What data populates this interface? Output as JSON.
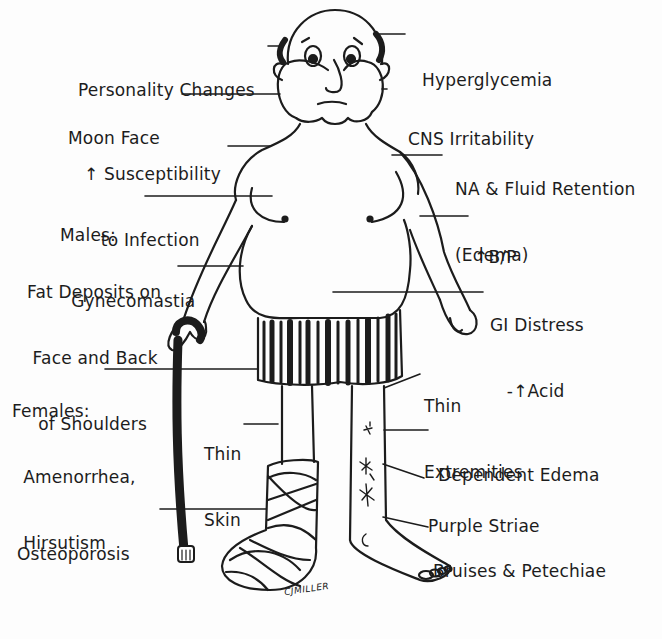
{
  "diagram": {
    "signature": "CJMILLER",
    "labels_left": [
      {
        "id": "personality-changes",
        "lines": [
          "Personality Changes"
        ],
        "x": 78,
        "y": 35
      },
      {
        "id": "moon-face",
        "lines": [
          "Moon Face"
        ],
        "x": 68,
        "y": 83
      },
      {
        "id": "susceptibility-infection",
        "lines": [
          "↑ Susceptibility",
          "   to Infection"
        ],
        "x": 84,
        "y": 119
      },
      {
        "id": "males-gynecomastia",
        "lines": [
          "Males:",
          "  Gynecomastia"
        ],
        "x": 60,
        "y": 180
      },
      {
        "id": "fat-deposits",
        "lines": [
          "Fat Deposits on",
          " Face and Back",
          "  of Shoulders"
        ],
        "x": 27,
        "y": 237
      },
      {
        "id": "females",
        "lines": [
          "Females:",
          "  Amenorrhea,",
          "  Hirsutism"
        ],
        "x": 12,
        "y": 356
      },
      {
        "id": "thin-skin",
        "lines": [
          "Thin",
          "Skin"
        ],
        "x": 204,
        "y": 399
      },
      {
        "id": "osteoporosis",
        "lines": [
          "Osteoporosis"
        ],
        "x": 17,
        "y": 499
      }
    ],
    "labels_right": [
      {
        "id": "hyperglycemia",
        "lines": [
          "Hyperglycemia"
        ],
        "x": 422,
        "y": 25
      },
      {
        "id": "cns-irritability",
        "lines": [
          "CNS Irritability"
        ],
        "x": 408,
        "y": 84
      },
      {
        "id": "na-fluid-retention",
        "lines": [
          "NA & Fluid Retention",
          "(Edema)"
        ],
        "x": 455,
        "y": 134
      },
      {
        "id": "blood-pressure",
        "lines": [
          "↑B/P"
        ],
        "x": 474,
        "y": 202
      },
      {
        "id": "gi-distress",
        "lines": [
          "GI Distress",
          "   -↑Acid"
        ],
        "x": 490,
        "y": 270
      },
      {
        "id": "thin-extremities",
        "lines": [
          "Thin",
          "Extremities"
        ],
        "x": 424,
        "y": 351
      },
      {
        "id": "dependent-edema",
        "lines": [
          "Dependent Edema"
        ],
        "x": 438,
        "y": 420
      },
      {
        "id": "purple-striae",
        "lines": [
          "Purple Striae"
        ],
        "x": 428,
        "y": 471
      },
      {
        "id": "bruises-petechiae",
        "lines": [
          "Bruises & Petechiae"
        ],
        "x": 433,
        "y": 516
      }
    ]
  },
  "colors": {
    "ink": "#1c1c1c",
    "paper": "#fdfdfd"
  }
}
